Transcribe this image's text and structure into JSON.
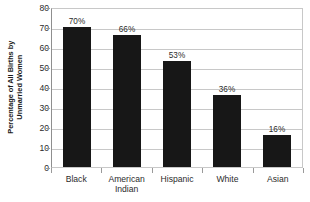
{
  "chart_data": {
    "type": "bar",
    "title": "",
    "xlabel": "",
    "ylabel": "Percentage of All Births by Unmarried Women",
    "ylabel_lines": [
      "Percentage of All Births by",
      "Unmarried Women"
    ],
    "categories": [
      "Black",
      "American Indian",
      "Hispanic",
      "White",
      "Asian"
    ],
    "category_lines": [
      [
        "Black"
      ],
      [
        "American",
        "Indian"
      ],
      [
        "Hispanic"
      ],
      [
        "White"
      ],
      [
        "Asian"
      ]
    ],
    "values": [
      70,
      66,
      53,
      36,
      16
    ],
    "data_labels": [
      "70%",
      "66%",
      "53%",
      "36%",
      "16%"
    ],
    "ylim": [
      0,
      80
    ],
    "ytick_step": 10,
    "ytick_labels": [
      "80",
      "70",
      "60",
      "50",
      "40",
      "30",
      "20",
      "10",
      "0"
    ],
    "ytick_values": [
      80,
      70,
      60,
      50,
      40,
      30,
      20,
      10,
      0
    ],
    "grid": true,
    "grid_axis": "y",
    "legend": false,
    "bar_color": "#171717",
    "grid_color": "#c8c8c8",
    "axis_color": "#8f8f8f",
    "text_color": "#2b2b2b",
    "background": "#ffffff"
  }
}
